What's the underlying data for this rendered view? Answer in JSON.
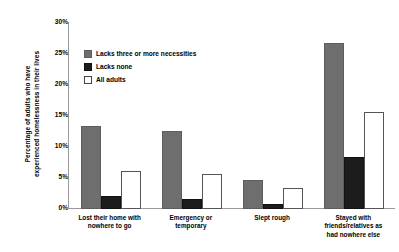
{
  "chart_data": {
    "type": "bar",
    "title": "",
    "xlabel": "",
    "ylabel": "Percentage of adults who have experienced homelessness in their lives",
    "ylabel_line1": "Percentage of adults who have",
    "ylabel_line2": "experienced homelessness in their lives",
    "ylim": [
      0,
      30
    ],
    "ytick_labels": [
      "0%",
      "5%",
      "10%",
      "15%",
      "20%",
      "25%",
      "30%"
    ],
    "ytick_values": [
      0,
      5,
      10,
      15,
      20,
      25,
      30
    ],
    "grid": false,
    "legend_position": "upper-left-inside",
    "categories": [
      "Lost their home with nowhere to go",
      "Emergency or temporary",
      "Slept rough",
      "Stayed with friends/relatives as had nowhere else"
    ],
    "category_lines": [
      [
        "Lost their home with",
        "nowhere to go"
      ],
      [
        "Emergency or",
        "temporary"
      ],
      [
        "Slept rough"
      ],
      [
        "Stayed with",
        "friends/relatives as",
        "had nowhere else"
      ]
    ],
    "series": [
      {
        "name": "Lacks three or more necessities",
        "color": "#6e6e6e",
        "values": [
          13.0,
          12.3,
          4.3,
          26.5
        ]
      },
      {
        "name": "Lacks none",
        "color": "#1c1c1c",
        "values": [
          1.8,
          1.3,
          0.5,
          8.0
        ]
      },
      {
        "name": "All adults",
        "color": "#ffffff",
        "values": [
          5.8,
          5.3,
          3.0,
          15.3
        ]
      }
    ]
  },
  "legend": {
    "items": [
      {
        "label": "Lacks three or more necessities",
        "swatch": "gray"
      },
      {
        "label": "Lacks none",
        "swatch": "black"
      },
      {
        "label": "All adults",
        "swatch": "white"
      }
    ]
  },
  "axis": {
    "axis_color": "#9a9a9a"
  }
}
